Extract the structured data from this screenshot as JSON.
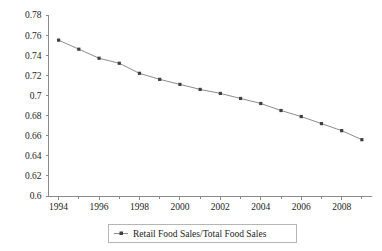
{
  "chart_data": {
    "type": "line",
    "title": "",
    "subtitle": "",
    "xlabel": "",
    "ylabel": "",
    "xlim": [
      1993.5,
      2009.5
    ],
    "ylim": [
      0.6,
      0.78
    ],
    "grid": false,
    "legend_position": "bottom-center",
    "x": [
      1994,
      1995,
      1996,
      1997,
      1998,
      1999,
      2000,
      2001,
      2002,
      2003,
      2004,
      2005,
      2006,
      2007,
      2008,
      2009
    ],
    "series": [
      {
        "name": "Retail Food Sales/Total Food Sales",
        "values": [
          0.755,
          0.746,
          0.737,
          0.732,
          0.722,
          0.716,
          0.711,
          0.706,
          0.702,
          0.697,
          0.692,
          0.685,
          0.679,
          0.672,
          0.665,
          0.656
        ],
        "color": "#8c8c8c",
        "marker_color": "#3d3d4e"
      }
    ],
    "y_ticks": [
      0.6,
      0.62,
      0.64,
      0.66,
      0.68,
      0.7,
      0.72,
      0.74,
      0.76,
      0.78
    ],
    "y_tick_labels": [
      "0.6",
      "0.62",
      "0.64",
      "0.66",
      "0.68",
      "0.7",
      "0.72",
      "0.74",
      "0.76",
      "0.78"
    ],
    "x_ticks": [
      1994,
      1995,
      1996,
      1997,
      1998,
      1999,
      2000,
      2001,
      2002,
      2003,
      2004,
      2005,
      2006,
      2007,
      2008,
      2009
    ],
    "x_tick_labels": [
      "1994",
      "",
      "1996",
      "",
      "1998",
      "",
      "2000",
      "",
      "2002",
      "",
      "2004",
      "",
      "2006",
      "",
      "2008",
      ""
    ]
  },
  "legend": {
    "entries": [
      {
        "label": "Retail Food Sales/Total Food Sales",
        "marker": "line-with-dot-marker"
      }
    ]
  },
  "colors": {
    "axis": "#8a8a8a",
    "line": "#8c8c8c",
    "marker": "#3d3d4e",
    "text": "#1c1c1c",
    "background": "#ffffff",
    "legend_border": "#b5b5b5"
  }
}
